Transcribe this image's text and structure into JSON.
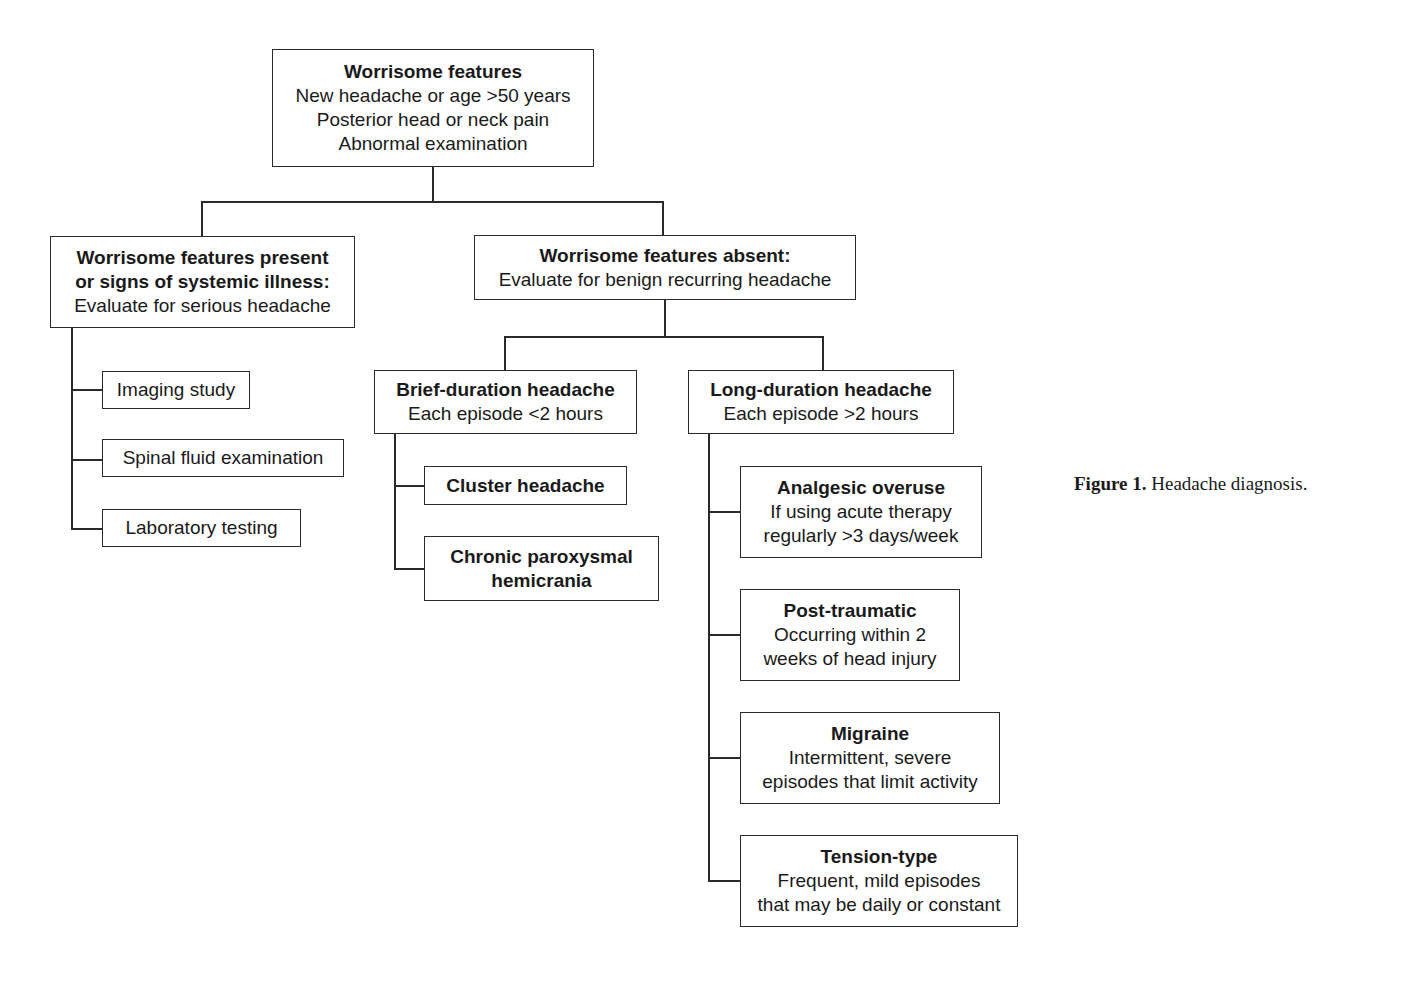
{
  "figure": {
    "caption_label": "Figure 1.",
    "caption_text": " Headache diagnosis."
  },
  "root": {
    "title": "Worrisome features",
    "lines": [
      "New headache or age >50 years",
      "Posterior head or neck pain",
      "Abnormal examination"
    ]
  },
  "present_branch": {
    "title_lines": [
      "Worrisome features present",
      "or signs of systemic illness:"
    ],
    "subtitle": "Evaluate for serious headache",
    "children": [
      {
        "label": "Imaging study"
      },
      {
        "label": "Spinal fluid examination"
      },
      {
        "label": "Laboratory testing"
      }
    ]
  },
  "absent_branch": {
    "title": "Worrisome features absent:",
    "subtitle": "Evaluate for benign recurring headache",
    "brief": {
      "title": "Brief-duration headache",
      "subtitle": "Each episode <2 hours",
      "children": [
        {
          "title_lines": [
            "Cluster headache"
          ]
        },
        {
          "title_lines": [
            "Chronic paroxysmal",
            "hemicrania"
          ]
        }
      ]
    },
    "long": {
      "title": "Long-duration headache",
      "subtitle": "Each episode >2 hours",
      "children": [
        {
          "title": "Analgesic overuse",
          "lines": [
            "If using acute therapy",
            "regularly >3 days/week"
          ]
        },
        {
          "title": "Post-traumatic",
          "lines": [
            "Occurring within 2",
            "weeks of head injury"
          ]
        },
        {
          "title": "Migraine",
          "lines": [
            "Intermittent, severe",
            "episodes that limit activity"
          ]
        },
        {
          "title": "Tension-type",
          "lines": [
            "Frequent, mild episodes",
            "that may be daily or constant"
          ]
        }
      ]
    }
  }
}
